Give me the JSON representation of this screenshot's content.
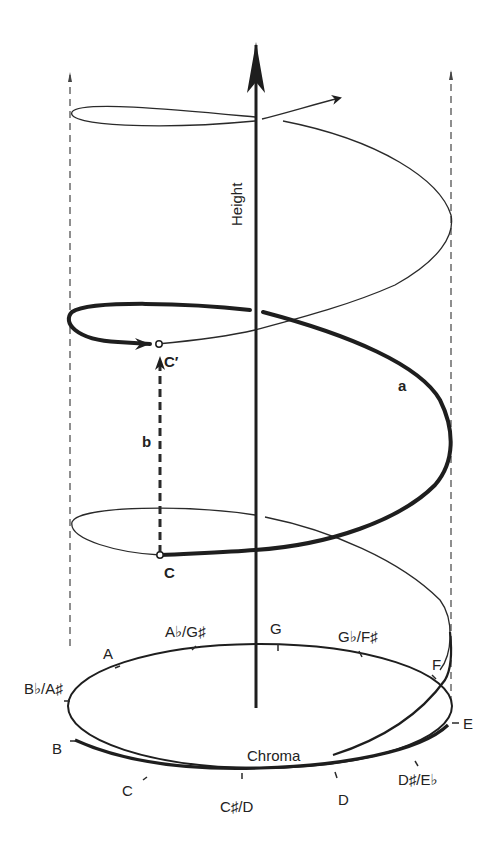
{
  "figure": {
    "type": "pitch-helix",
    "axis_label": "Height",
    "circle_label": "Chroma",
    "segment_labels": {
      "arc": "a",
      "vertical": "b"
    },
    "point_labels": {
      "lower": "C",
      "upper": "C′"
    },
    "chroma_notes": [
      {
        "id": "g",
        "label": "G"
      },
      {
        "id": "gb-fsharp",
        "label": "G♭/F♯"
      },
      {
        "id": "f",
        "label": "F"
      },
      {
        "id": "e",
        "label": "E"
      },
      {
        "id": "dsharp-eb",
        "label": "D♯/E♭"
      },
      {
        "id": "d",
        "label": "D"
      },
      {
        "id": "csharp-d",
        "label": "C♯/D"
      },
      {
        "id": "c",
        "label": "C"
      },
      {
        "id": "b",
        "label": "B"
      },
      {
        "id": "bb-asharp",
        "label": "B♭/A♯"
      },
      {
        "id": "a",
        "label": "A"
      },
      {
        "id": "ab-gsharp",
        "label": "A♭/G♯"
      }
    ],
    "colors": {
      "line": "#1e1e1e",
      "background": "#ffffff"
    }
  }
}
